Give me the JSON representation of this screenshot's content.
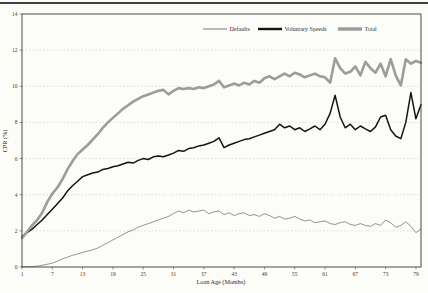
{
  "page": {
    "background": "#fcfcf9",
    "top_rule_color": "#3f3f3f"
  },
  "chart_data": {
    "type": "line",
    "xlabel": "Loan Age (Months)",
    "ylabel": "CPR (%)",
    "xlim": [
      1,
      80
    ],
    "ylim": [
      0,
      14
    ],
    "x_ticks": [
      1,
      7,
      13,
      19,
      25,
      31,
      37,
      43,
      49,
      55,
      61,
      67,
      73,
      79
    ],
    "y_ticks": [
      0,
      2,
      4,
      6,
      8,
      10,
      12,
      14
    ],
    "grid": "horizontal-dashed",
    "legend_position": "top-inside",
    "x": [
      1,
      2,
      3,
      4,
      5,
      6,
      7,
      8,
      9,
      10,
      11,
      12,
      13,
      14,
      15,
      16,
      17,
      18,
      19,
      20,
      21,
      22,
      23,
      24,
      25,
      26,
      27,
      28,
      29,
      30,
      31,
      32,
      33,
      34,
      35,
      36,
      37,
      38,
      39,
      40,
      41,
      42,
      43,
      44,
      45,
      46,
      47,
      48,
      49,
      50,
      51,
      52,
      53,
      54,
      55,
      56,
      57,
      58,
      59,
      60,
      61,
      62,
      63,
      64,
      65,
      66,
      67,
      68,
      69,
      70,
      71,
      72,
      73,
      74,
      75,
      76,
      77,
      78,
      79,
      80
    ],
    "series": [
      {
        "name": "Defaults",
        "color": "#666666",
        "stroke_width": 0.7,
        "legend_stroke": 0.9,
        "values": [
          0.02,
          0.02,
          0.03,
          0.05,
          0.1,
          0.15,
          0.22,
          0.32,
          0.45,
          0.55,
          0.65,
          0.72,
          0.8,
          0.88,
          0.95,
          1.05,
          1.2,
          1.35,
          1.5,
          1.65,
          1.8,
          1.95,
          2.05,
          2.2,
          2.3,
          2.4,
          2.5,
          2.6,
          2.7,
          2.8,
          2.95,
          3.1,
          3.0,
          3.15,
          3.05,
          3.1,
          3.15,
          2.95,
          3.05,
          3.1,
          2.9,
          3.0,
          2.85,
          2.95,
          3.0,
          2.85,
          2.9,
          2.8,
          2.95,
          2.85,
          2.7,
          2.8,
          2.65,
          2.7,
          2.8,
          2.65,
          2.55,
          2.6,
          2.45,
          2.5,
          2.55,
          2.4,
          2.35,
          2.45,
          2.5,
          2.35,
          2.3,
          2.4,
          2.3,
          2.25,
          2.4,
          2.3,
          2.6,
          2.45,
          2.2,
          2.3,
          2.5,
          2.25,
          1.9,
          2.1
        ]
      },
      {
        "name": "Voluntary Speeds",
        "color": "#141414",
        "stroke_width": 1.5,
        "legend_stroke": 2.4,
        "values": [
          1.7,
          1.9,
          2.1,
          2.35,
          2.6,
          2.9,
          3.2,
          3.5,
          3.8,
          4.2,
          4.5,
          4.75,
          5.0,
          5.1,
          5.2,
          5.25,
          5.4,
          5.45,
          5.55,
          5.6,
          5.7,
          5.8,
          5.75,
          5.9,
          6.0,
          5.95,
          6.1,
          6.15,
          6.1,
          6.2,
          6.3,
          6.45,
          6.4,
          6.55,
          6.6,
          6.7,
          6.75,
          6.85,
          6.95,
          7.15,
          6.6,
          6.75,
          6.85,
          6.95,
          7.05,
          7.1,
          7.2,
          7.3,
          7.4,
          7.5,
          7.6,
          7.9,
          7.7,
          7.8,
          7.6,
          7.7,
          7.5,
          7.65,
          7.8,
          7.6,
          7.9,
          8.5,
          9.5,
          8.3,
          7.7,
          7.9,
          7.6,
          7.8,
          7.65,
          7.5,
          7.75,
          8.3,
          8.4,
          7.6,
          7.25,
          7.1,
          8.0,
          9.65,
          8.2,
          9.0
        ]
      },
      {
        "name": "Total",
        "color": "#9c9c9c",
        "stroke_width": 2.6,
        "legend_stroke": 3.4,
        "values": [
          1.6,
          1.95,
          2.3,
          2.6,
          3.0,
          3.6,
          4.05,
          4.4,
          4.85,
          5.4,
          5.85,
          6.25,
          6.5,
          6.75,
          7.05,
          7.35,
          7.7,
          8.0,
          8.25,
          8.5,
          8.75,
          8.95,
          9.15,
          9.3,
          9.45,
          9.55,
          9.65,
          9.75,
          9.8,
          9.55,
          9.75,
          9.9,
          9.85,
          9.9,
          9.85,
          9.95,
          9.9,
          10.0,
          10.1,
          10.3,
          9.95,
          10.05,
          10.15,
          10.05,
          10.2,
          10.1,
          10.3,
          10.2,
          10.45,
          10.55,
          10.4,
          10.55,
          10.7,
          10.55,
          10.75,
          10.65,
          10.5,
          10.6,
          10.7,
          10.55,
          10.5,
          10.2,
          11.55,
          11.0,
          10.7,
          10.8,
          11.1,
          10.6,
          11.35,
          11.0,
          10.75,
          11.25,
          10.55,
          11.5,
          10.6,
          10.05,
          11.5,
          11.25,
          11.4,
          11.3
        ]
      }
    ]
  }
}
